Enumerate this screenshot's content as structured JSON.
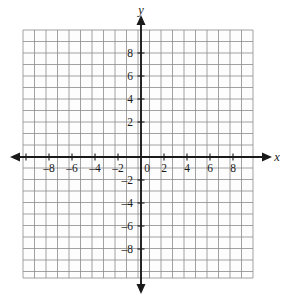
{
  "figure": {
    "kind": "cartesian-coordinate-grid",
    "background_color": "#ffffff",
    "grid_line_color": "#8a8a8a",
    "axis_line_color": "#1a1a1a",
    "label_color": "#1a1a1a"
  },
  "grid": {
    "left_px": 23,
    "top_px": 30,
    "right_px": 253,
    "bottom_px": 278,
    "columns": 20,
    "rows": 22,
    "cell_px": 11.5,
    "show_grid": true
  },
  "axes": {
    "origin": {
      "x_px": 141,
      "y_px": 157
    },
    "unit_px": 11.5,
    "x_axis": {
      "name": "x",
      "name_x_px": 277,
      "name_y_px": 161,
      "min": -10,
      "max": 10,
      "tick_step": 1,
      "label_step": 2,
      "labels": [
        "–8",
        "–6",
        "–4",
        "–2",
        "2",
        "4",
        "6",
        "8"
      ],
      "label_values": [
        -8,
        -6,
        -4,
        -2,
        2,
        4,
        6,
        8
      ],
      "arrow_left": true,
      "arrow_right": true
    },
    "y_axis": {
      "name": "y",
      "name_x_px": 141,
      "name_y_px": 14,
      "min": -10,
      "max": 11,
      "tick_step": 1,
      "label_step": 2,
      "labels": [
        "8",
        "6",
        "4",
        "2",
        "–2",
        "–4",
        "–6",
        "–8"
      ],
      "label_values": [
        8,
        6,
        4,
        2,
        -2,
        -4,
        -6,
        -8
      ],
      "arrow_up": true,
      "arrow_down": true
    },
    "origin_label": "0"
  },
  "data": {
    "plotted_points": [],
    "plotted_curves": []
  }
}
